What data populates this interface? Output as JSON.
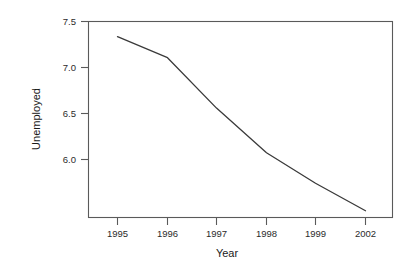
{
  "chart_data": {
    "type": "line",
    "title": "",
    "subtitle": "",
    "xlabel": "Year",
    "ylabel": "Unemployed",
    "x_tick_labels": [
      "1995",
      "1996",
      "1997",
      "1998",
      "1999",
      "2002"
    ],
    "y_tick_labels": [
      "7.5",
      "7.0",
      "6.5",
      "6.0"
    ],
    "y_tick_values": [
      7.5,
      7.0,
      6.5,
      6.0
    ],
    "xlim": [
      1994.45,
      2002.55
    ],
    "ylim": [
      5.5,
      7.56
    ],
    "grid": false,
    "legend": false,
    "legend_position": "none",
    "line_color": "#3a3a3a",
    "frame_color": "#5a5a5a",
    "background": "#ffffff",
    "categories": [
      "1995",
      "1996",
      "1997",
      "1998",
      "1999",
      "2002"
    ],
    "values": [
      7.4,
      7.18,
      6.65,
      6.18,
      5.86,
      5.57
    ],
    "series": [
      {
        "name": "Unemployed",
        "x": [
          "1995",
          "1996",
          "1997",
          "1998",
          "1999",
          "2002"
        ],
        "values": [
          7.4,
          7.18,
          6.65,
          6.18,
          5.86,
          5.57
        ]
      }
    ],
    "annotations": []
  },
  "axes": {
    "y_title": "Unemployed",
    "x_title": "Year"
  }
}
